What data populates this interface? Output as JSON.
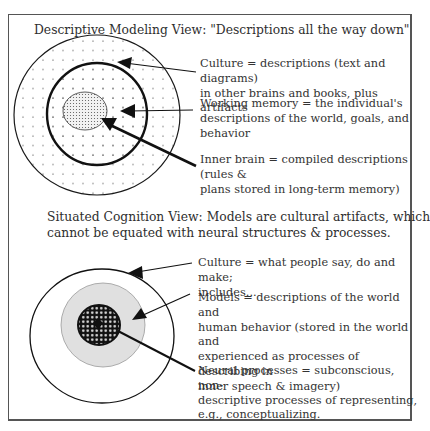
{
  "top_view": {
    "title": "Descriptive Modeling View: \"Descriptions all the way down\"",
    "labels": {
      "culture_1": "Culture =  descriptions (text and diagrams)",
      "culture_2": "in other brains and books, plus artifacts",
      "working_1": "Working memory =  the individual's",
      "working_2": "descriptions of the world, goals, and",
      "working_3": "behavior",
      "inner_1": "Inner brain = compiled descriptions (rules &",
      "inner_2": "plans stored in long-term memory)"
    }
  },
  "bottom_view": {
    "title_1": "Situated Cognition View: Models are cultural artifacts, which",
    "title_2": "cannot be equated with neural structures & processes.",
    "labels": {
      "culture_1": "Culture = what people say, do and make;",
      "culture_2": "includes...",
      "models_1": "Models = descriptions of the world and",
      "models_2": "human behavior (stored in the world and",
      "models_3": "experienced as processes of describing in",
      "models_4": "inner speech & imagery)",
      "neural_1": "Neural processes = subconscious, non-",
      "neural_2": "descriptive processes of representing,",
      "neural_3": "e.g., conceptualizing."
    }
  },
  "colors": {
    "line": "#1a1a1a",
    "models_fill": "#e0e0e0",
    "frame": "#555555"
  }
}
